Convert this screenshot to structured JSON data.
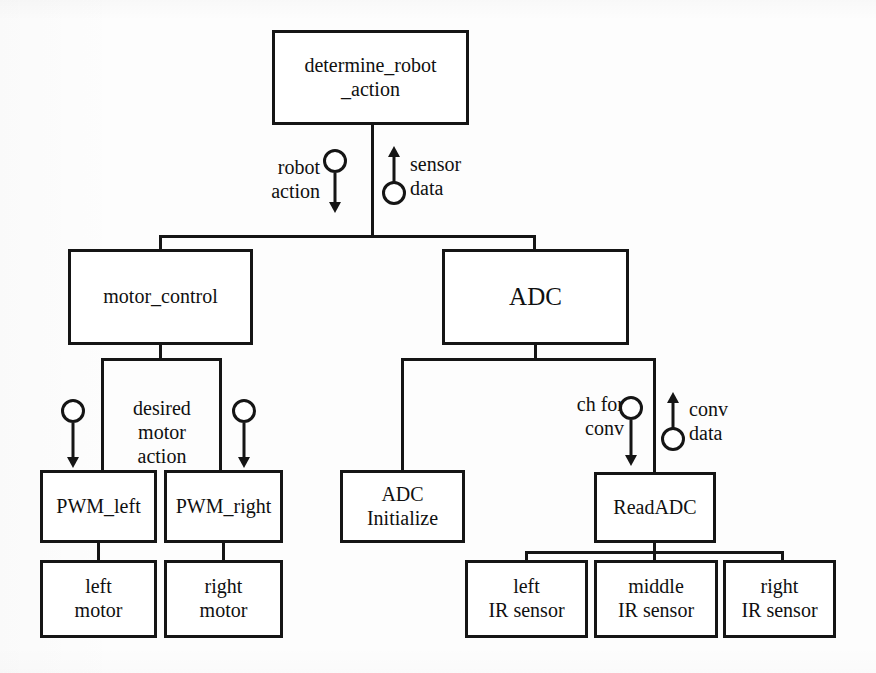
{
  "diagram": {
    "type": "block-hierarchy",
    "accent_color": "#151515",
    "background_color": "#fdfdfd",
    "nodes": {
      "determine_robot_action": "determine_robot\n_action",
      "motor_control": "motor_control",
      "adc": "ADC",
      "pwm_left": "PWM_left",
      "pwm_right": "PWM_right",
      "left_motor": "left\nmotor",
      "right_motor": "right\nmotor",
      "adc_initialize": "ADC\nInitialize",
      "read_adc": "ReadADC",
      "left_ir_sensor": "left\nIR sensor",
      "middle_ir_sensor": "middle\nIR sensor",
      "right_ir_sensor": "right\nIR sensor"
    },
    "edge_labels": {
      "robot_action": "robot\naction",
      "sensor_data": "sensor\ndata",
      "desired_motor_action": "desired\nmotor\naction",
      "ch_for_conv": "ch for\nconv",
      "conv_data": "conv\ndata"
    }
  }
}
